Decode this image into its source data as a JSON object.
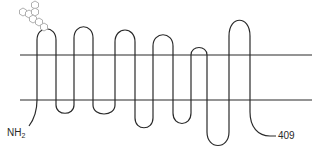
{
  "diagram": {
    "type": "seven-transmembrane-protein-topology",
    "n_terminus_label": "NH",
    "n_terminus_subscript": "2",
    "c_terminus_label": "409",
    "membrane_lines": 2,
    "transmembrane_segments": 7,
    "glycosylation_chain": "hexagon-sugar-chain",
    "colors": {
      "line": "#2a2a2a",
      "sugar": "#b0b0b0",
      "background": "#ffffff"
    }
  }
}
